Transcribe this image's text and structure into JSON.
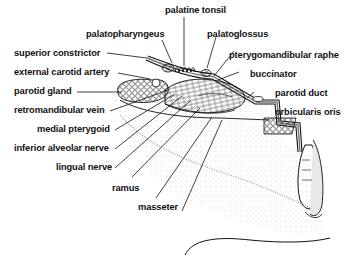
{
  "figure": {
    "type": "anatomical-diagram",
    "colors": {
      "ink": "#111111",
      "background": "#ffffff",
      "stipple": "#9a9a9a"
    }
  },
  "labels": {
    "palatine_tonsil": "palatine tonsil",
    "palatopharyngeus": "palatopharyngeus",
    "palatoglossus": "palatoglossus",
    "superior_constrictor": "superior constrictor",
    "pterygomandibular_raphe": "pterygomandibular raphe",
    "external_carotid_artery": "external carotid artery",
    "buccinator": "buccinator",
    "parotid_gland": "parotid gland",
    "parotid_duct": "parotid duct",
    "retromandibular_vein": "retromandibular vein",
    "orbicularis_oris": "orbicularis oris",
    "medial_pterygoid": "medial pterygoid",
    "inferior_alveolar_nerve": "inferior alveolar nerve",
    "lingual_nerve": "lingual nerve",
    "ramus": "ramus",
    "masseter": "masseter"
  }
}
